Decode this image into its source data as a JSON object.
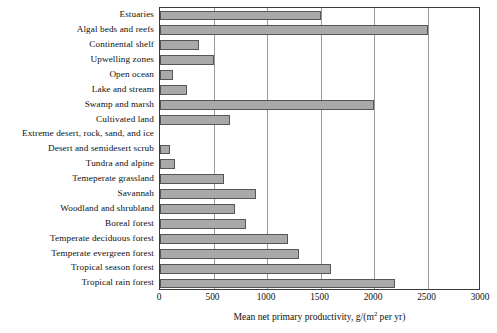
{
  "chart_data": {
    "type": "bar",
    "orientation": "horizontal",
    "title": "",
    "xlabel": "Mean net primary productivity, g/(m² per yr)",
    "ylabel": "",
    "xlim": [
      0,
      3000
    ],
    "xticks": [
      0,
      500,
      1000,
      1500,
      2000,
      2500,
      3000
    ],
    "xtick_labels": [
      "0",
      "500",
      "1000",
      "1500",
      "2000",
      "2500",
      "3000"
    ],
    "grid": "vertical gridlines at each x tick",
    "legend": "none",
    "categories": [
      "Estuaries",
      "Algal beds and reefs",
      "Continental shelf",
      "Upwelling zones",
      "Open ocean",
      "Lake and stream",
      "Swamp and marsh",
      "Cultivated land",
      "Extreme desert, rock, sand, and ice",
      "Desert and semidesert scrub",
      "Tundra and alpine",
      "Temeperate grassland",
      "Savannah",
      "Woodland and shrubland",
      "Boreal forest",
      "Temperate deciduous forest",
      "Temperate evergreen forest",
      "Tropical season forest",
      "Tropical rain forest"
    ],
    "values": [
      1500,
      2500,
      360,
      500,
      125,
      250,
      2000,
      650,
      3,
      90,
      140,
      600,
      900,
      700,
      800,
      1200,
      1300,
      1600,
      2200
    ]
  },
  "style": {
    "bar_fill": "#a9a9a9",
    "bar_border": "#565656",
    "axis_color": "#3a3a3a",
    "grid_color": "#9a9a9a",
    "text_color": "#101010",
    "background": "#ffffff"
  }
}
